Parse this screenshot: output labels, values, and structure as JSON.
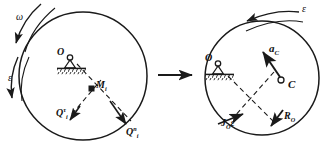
{
  "figure": {
    "ink_color": "#1a1a1a",
    "background": "#ffffff"
  },
  "transition_arrow": {
    "name": "right-arrow",
    "glyph": "→"
  },
  "left_diagram": {
    "name": "left-free-body-diagram",
    "circle": {
      "cx": 83,
      "cy": 76,
      "r": 64
    },
    "support": {
      "label": "O",
      "type": "pin-support",
      "x": 60,
      "y": 56
    },
    "mass_point": {
      "label_main": "M",
      "label_sub": "i",
      "x": 92,
      "y": 89
    },
    "labels": [
      {
        "id": "omega",
        "text": "ω",
        "x": 18,
        "y": 18
      },
      {
        "id": "epsilon",
        "text": "ε",
        "x": 9,
        "y": 78
      },
      {
        "id": "Q-tau",
        "main": "Q",
        "sup": "τ",
        "sub": "i",
        "x": 58,
        "y": 112
      },
      {
        "id": "Q-n",
        "main": "Q",
        "sup": "n",
        "sub": "i",
        "x": 127,
        "y": 131
      }
    ]
  },
  "right_diagram": {
    "name": "right-equivalent-diagram",
    "circle": {
      "cx": 262,
      "cy": 78,
      "r": 57
    },
    "support": {
      "label": "O",
      "type": "pin-support",
      "x": 207,
      "y": 62
    },
    "center_of_mass": {
      "label": "C",
      "x": 288,
      "y": 85
    },
    "labels": [
      {
        "id": "epsilon",
        "text": "ε",
        "x": 303,
        "y": 9
      },
      {
        "id": "a-C",
        "main": "a",
        "sub": "C",
        "x": 272,
        "y": 50
      },
      {
        "id": "J-O-epsilon",
        "main": "J",
        "sub": "O",
        "tail": "ε",
        "x": 222,
        "y": 122
      },
      {
        "id": "R-O",
        "main": "R",
        "sub": "O",
        "x": 283,
        "y": 116
      }
    ]
  },
  "legend_meaning": {
    "omega": "angular velocity",
    "epsilon": "angular acceleration",
    "Q_tau_i": "tangential inertia force of particle i",
    "Q_n_i": "normal inertia force of particle i",
    "M_i": "particle of mass i",
    "a_C": "acceleration of mass centre C",
    "J_O_epsilon": "inertia couple about O",
    "R_O": "resultant inertia force at O",
    "C": "centre of mass"
  }
}
